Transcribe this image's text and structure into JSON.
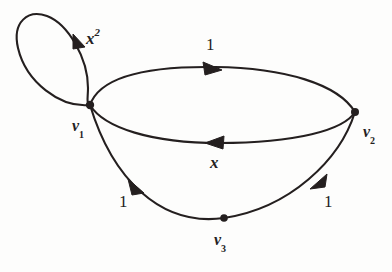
{
  "figure": {
    "kind": "directed-multigraph-diagram",
    "background_color": "#fdfdfc",
    "ink_color": "#241f1f"
  },
  "vertices": [
    {
      "id": "v1",
      "label_base": "v",
      "label_sub": "1",
      "x": 90,
      "y": 105,
      "label_x": 72,
      "label_y": 118
    },
    {
      "id": "v2",
      "label_base": "v",
      "label_sub": "2",
      "x": 355,
      "y": 112,
      "label_x": 363,
      "label_y": 124
    },
    {
      "id": "v3",
      "label_base": "v",
      "label_sub": "3",
      "x": 224,
      "y": 218,
      "label_x": 214,
      "label_y": 232
    }
  ],
  "edges": [
    {
      "id": "loop-v1",
      "from": "v1",
      "to": "v1",
      "weight_base": "x",
      "weight_sup": "2",
      "weight_x": 86,
      "weight_y": 28,
      "style": "self-loop-ellipse"
    },
    {
      "id": "v1-to-v2-top",
      "from": "v1",
      "to": "v2",
      "weight_base": "1",
      "weight_sup": "",
      "weight_x": 206,
      "weight_y": 36,
      "style": "upper-arc"
    },
    {
      "id": "v2-to-v1-middle",
      "from": "v2",
      "to": "v1",
      "weight_base": "x",
      "weight_sup": "",
      "weight_x": 210,
      "weight_y": 154,
      "style": "middle-arc"
    },
    {
      "id": "v3-to-v1-lower-left",
      "from": "v3",
      "to": "v1",
      "weight_base": "1",
      "weight_sup": "",
      "weight_x": 119,
      "weight_y": 193,
      "style": "lower-left-arc"
    },
    {
      "id": "v2-to-v3-lower-right",
      "from": "v2",
      "to": "v3",
      "weight_base": "1",
      "weight_sup": "",
      "weight_x": 324,
      "weight_y": 193,
      "style": "lower-right-arc"
    }
  ]
}
